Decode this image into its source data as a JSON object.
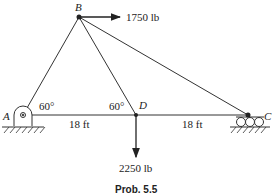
{
  "figure": {
    "caption": "Prob. 5.5",
    "nodes": {
      "A": "A",
      "B": "B",
      "C": "C",
      "D": "D"
    },
    "angles": {
      "at_A": "60°",
      "at_D": "60°"
    },
    "dimensions": {
      "AD": "18 ft",
      "DC": "18 ft"
    },
    "loads": {
      "horizontal_at_B": "1750 lb",
      "vertical_at_D": "2250 lb"
    },
    "members": [
      "AB",
      "BD",
      "BC",
      "AD",
      "DC"
    ],
    "supports": {
      "A": "pin",
      "C": "roller"
    }
  }
}
